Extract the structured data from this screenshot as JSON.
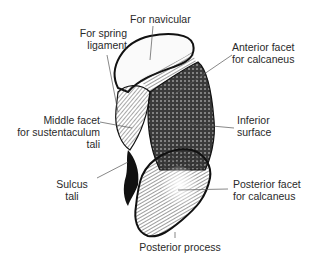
{
  "figure": {
    "labels": {
      "navicular": "For navicular",
      "spring_1": "For spring",
      "spring_2": "ligament",
      "anterior_1": "Anterior facet",
      "anterior_2": "for calcaneus",
      "middle_1": "Middle facet",
      "middle_2": "for sustentaculum",
      "middle_3": "tali",
      "inferior_1": "Inferior",
      "inferior_2": "surface",
      "sulcus_1": "Sulcus",
      "sulcus_2": "tali",
      "posterior_facet_1": "Posterior facet",
      "posterior_facet_2": "for calcaneus",
      "posterior_process": "Posterior process"
    },
    "colors": {
      "ink": "#1a1a1a",
      "text": "#2a2a2a",
      "leader": "#555555",
      "background": "#ffffff"
    }
  }
}
